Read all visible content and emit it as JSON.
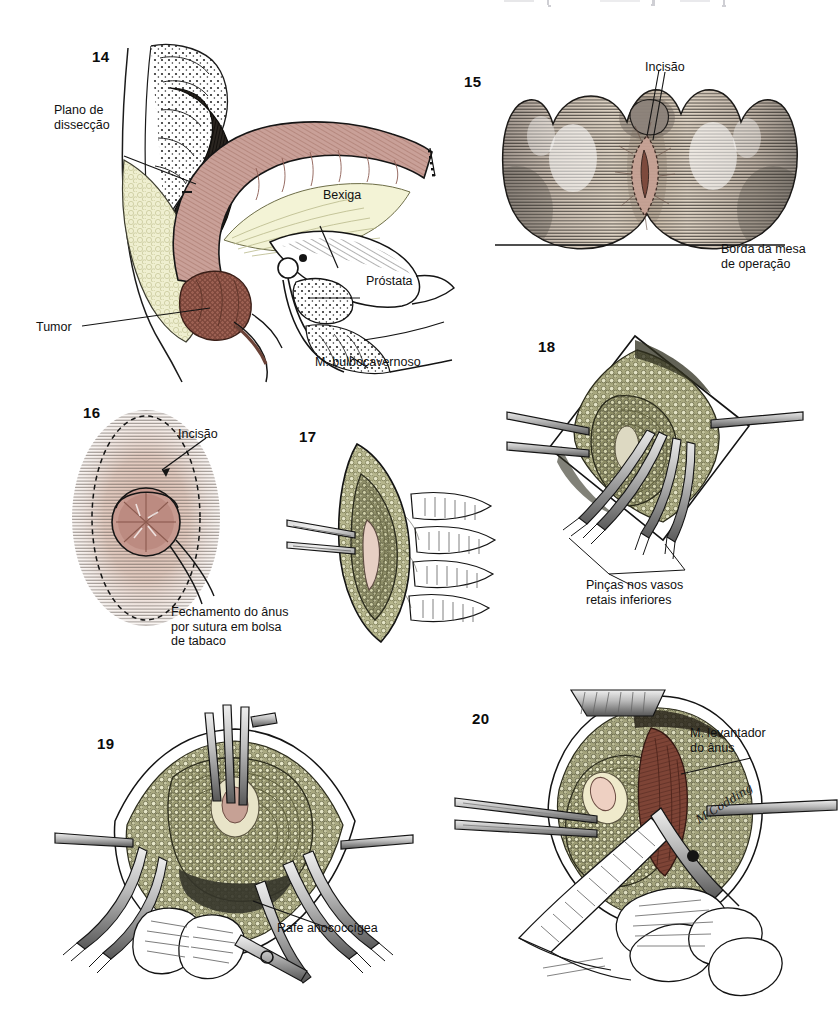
{
  "page": {
    "background": "#ffffff",
    "width": 839,
    "height": 1029,
    "language": "pt-BR",
    "artist_signature": "M.Codding"
  },
  "colors": {
    "ink": "#141414",
    "rectum_pink": "#c49a92",
    "rectum_pink_dark": "#9d6a60",
    "mesentery_cream": "#efefd0",
    "mesentery_cream_dark": "#d8d7ad",
    "tumor_brown": "#9c6052",
    "tumor_brown_dark": "#6e3c30",
    "fat_olive": "#b9b98f",
    "fat_olive_dark": "#7c7c56",
    "fat_highlight": "#e8e8cc",
    "skin_beige": "#cdbbab",
    "skin_grey": "#a69c96",
    "levator_maroon": "#7e4436",
    "steel": "#cfcfcf",
    "steel_dark": "#6a6a6a",
    "anus_rose": "#c08f86"
  },
  "figures": [
    {
      "id": "fig-14",
      "number": "14",
      "title": "Corte sagital da pelve masculina",
      "labels": [
        {
          "name": "plano-de-disseccao",
          "text": "Plano de\ndissecção",
          "align": "left"
        },
        {
          "name": "bexiga",
          "text": "Bexiga",
          "align": "left"
        },
        {
          "name": "prostata",
          "text": "Próstata",
          "align": "left"
        },
        {
          "name": "tumor",
          "text": "Tumor",
          "align": "left"
        },
        {
          "name": "m-bulbocavernoso",
          "text": "M. bulbocavernoso",
          "align": "left"
        }
      ]
    },
    {
      "id": "fig-15",
      "number": "15",
      "title": "Posição do paciente e incisão perineal",
      "labels": [
        {
          "name": "incisao",
          "text": "Incisão",
          "align": "left"
        },
        {
          "name": "borda-da-mesa",
          "text": "Borda da mesa\nde operação",
          "align": "left"
        }
      ]
    },
    {
      "id": "fig-16",
      "number": "16",
      "title": "Incisão elíptica perianal",
      "labels": [
        {
          "name": "incisao",
          "text": "Incisão",
          "align": "left"
        },
        {
          "name": "fechamento-do-anus",
          "text": "Fechamento do ânus\npor sutura em bolsa\nde tabaco",
          "align": "left"
        }
      ]
    },
    {
      "id": "fig-17",
      "number": "17",
      "title": "Dissecção da fossa isquiorretal",
      "labels": []
    },
    {
      "id": "fig-18",
      "number": "18",
      "title": "Pinçamento dos vasos retais inferiores",
      "labels": [
        {
          "name": "pincas-nos-vasos",
          "text": "Pinças nos vasos\nretais inferiores",
          "align": "left"
        }
      ]
    },
    {
      "id": "fig-19",
      "number": "19",
      "title": "Exposição da rafe anococcígea",
      "labels": [
        {
          "name": "rafe-anococcigea",
          "text": "Rafe anococcígea",
          "align": "left"
        }
      ]
    },
    {
      "id": "fig-20",
      "number": "20",
      "title": "Secção do músculo levantador do ânus",
      "labels": [
        {
          "name": "m-levantador-do-anus",
          "text": "M. levantador\ndo ânus",
          "align": "left"
        }
      ]
    }
  ]
}
